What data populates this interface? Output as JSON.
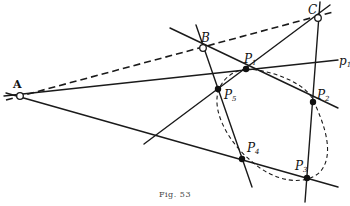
{
  "figure": {
    "caption": "Fig. 53",
    "points": {
      "A": {
        "label": "A",
        "type": "open"
      },
      "B": {
        "label": "B",
        "type": "open"
      },
      "C": {
        "label": "C",
        "type": "open"
      },
      "P1": {
        "label": "P",
        "sub": "1",
        "type": "solid"
      },
      "P2": {
        "label": "P",
        "sub": "2",
        "type": "solid"
      },
      "P3": {
        "label": "P",
        "sub": "3",
        "type": "solid"
      },
      "P4": {
        "label": "P",
        "sub": "4",
        "type": "solid"
      },
      "P5": {
        "label": "P",
        "sub": "5",
        "type": "solid"
      }
    },
    "line_labels": {
      "p1": {
        "label": "p",
        "sub": "1"
      }
    },
    "curve": {
      "name": "conic through P1–P5",
      "style": "dashed"
    }
  }
}
